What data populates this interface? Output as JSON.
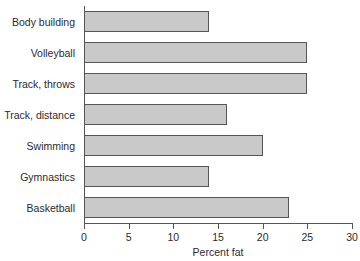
{
  "chart_data": {
    "type": "bar",
    "orientation": "horizontal",
    "title": "",
    "xlabel": "Percent fat",
    "ylabel": "",
    "categories": [
      "Body building",
      "Volleyball",
      "Track, throws",
      "Track, distance",
      "Swimming",
      "Gymnastics",
      "Basketball"
    ],
    "values": [
      14,
      25,
      25,
      16,
      20,
      14,
      23
    ],
    "xlim": [
      0,
      30
    ],
    "xticks": [
      0,
      5,
      10,
      15,
      20,
      25,
      30
    ],
    "xtick_labels": [
      "0",
      "5",
      "10",
      "15",
      "20",
      "25",
      "30"
    ],
    "grid": false,
    "legend": null,
    "bar_fill_color": "#c9c9c9",
    "bar_edge_color": "#555555",
    "axis_color": "#555555",
    "background_color": "#ffffff"
  }
}
